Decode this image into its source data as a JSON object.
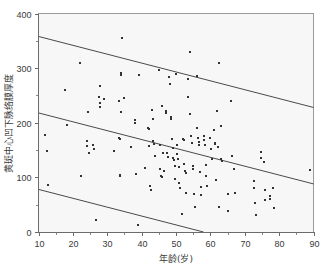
{
  "chart_data": {
    "type": "scatter",
    "title": "",
    "xlabel": "年龄(岁)",
    "ylabel": "黄斑中心凹下脉络膜厚度",
    "xlim": [
      10,
      90
    ],
    "ylim": [
      0,
      400
    ],
    "xticks": [
      10,
      20,
      30,
      40,
      50,
      60,
      70,
      80,
      90
    ],
    "yticks": [
      0,
      100,
      200,
      300,
      400
    ],
    "xtick_labels": [
      "10",
      "20",
      "30",
      "40",
      "50",
      "60",
      "70",
      "80",
      "90"
    ],
    "ytick_labels": [
      "0",
      "100",
      "200",
      "300",
      "400"
    ],
    "x_minor_ticks": [
      15,
      25,
      35,
      45,
      55,
      65,
      75,
      85
    ],
    "y_minor_ticks": [
      50,
      150,
      250,
      350
    ],
    "grid": false,
    "legend": null,
    "marker": "square",
    "marker_size": 2,
    "marker_color": "#333333",
    "plot_background": "#f7f7f7",
    "axis_color": "#6b6b6b",
    "line_color": "#4a4a4a",
    "series": [
      {
        "name": "subfoveal choroidal thickness",
        "points": [
          [
            12.0,
            177
          ],
          [
            12.6,
            148
          ],
          [
            12.8,
            86
          ],
          [
            17.8,
            260
          ],
          [
            18.2,
            196
          ],
          [
            22.2,
            310
          ],
          [
            22.5,
            103
          ],
          [
            24.0,
            166
          ],
          [
            24.2,
            158
          ],
          [
            24.4,
            220
          ],
          [
            24.6,
            145
          ],
          [
            25.8,
            160
          ],
          [
            26.0,
            152
          ],
          [
            26.8,
            22
          ],
          [
            27.6,
            247
          ],
          [
            27.8,
            237
          ],
          [
            27.9,
            228
          ],
          [
            28.0,
            267
          ],
          [
            29.0,
            243
          ],
          [
            32.0,
            148
          ],
          [
            33.4,
            240
          ],
          [
            33.5,
            173
          ],
          [
            33.6,
            171
          ],
          [
            33.7,
            105
          ],
          [
            33.8,
            102
          ],
          [
            33.9,
            219
          ],
          [
            34.0,
            287
          ],
          [
            34.1,
            292
          ],
          [
            34.2,
            356
          ],
          [
            35.0,
            245
          ],
          [
            36.8,
            156
          ],
          [
            38.0,
            205
          ],
          [
            38.2,
            200
          ],
          [
            38.4,
            107
          ],
          [
            38.8,
            12
          ],
          [
            39.2,
            288
          ],
          [
            41.0,
            117
          ],
          [
            41.8,
            190
          ],
          [
            42.0,
            189
          ],
          [
            42.2,
            158
          ],
          [
            42.4,
            84
          ],
          [
            42.6,
            76
          ],
          [
            43.0,
            223
          ],
          [
            43.2,
            207
          ],
          [
            43.4,
            167
          ],
          [
            43.6,
            161
          ],
          [
            44.0,
            140
          ],
          [
            45.0,
            297
          ],
          [
            45.2,
            159
          ],
          [
            45.4,
            115
          ],
          [
            45.6,
            103
          ],
          [
            45.8,
            100
          ],
          [
            46.0,
            230
          ],
          [
            46.2,
            145
          ],
          [
            46.4,
            111
          ],
          [
            47.0,
            218
          ],
          [
            47.2,
            222
          ],
          [
            47.4,
            144
          ],
          [
            47.6,
            138
          ],
          [
            48.0,
            284
          ],
          [
            48.2,
            271
          ],
          [
            48.4,
            210
          ],
          [
            48.6,
            206
          ],
          [
            48.8,
            171
          ],
          [
            49.0,
            153
          ],
          [
            49.2,
            135
          ],
          [
            49.4,
            132
          ],
          [
            49.6,
            121
          ],
          [
            49.8,
            97
          ],
          [
            50.0,
            289
          ],
          [
            50.2,
            159
          ],
          [
            50.4,
            142
          ],
          [
            50.6,
            133
          ],
          [
            50.8,
            119
          ],
          [
            51.0,
            89
          ],
          [
            51.2,
            80
          ],
          [
            51.6,
            33
          ],
          [
            52.0,
            171
          ],
          [
            52.2,
            169
          ],
          [
            52.4,
            125
          ],
          [
            52.6,
            112
          ],
          [
            52.8,
            108
          ],
          [
            53.0,
            72
          ],
          [
            53.4,
            281
          ],
          [
            53.6,
            248
          ],
          [
            54.0,
            330
          ],
          [
            54.2,
            216
          ],
          [
            54.4,
            176
          ],
          [
            54.6,
            163
          ],
          [
            54.8,
            120
          ],
          [
            55.0,
            116
          ],
          [
            55.2,
            70
          ],
          [
            55.4,
            46
          ],
          [
            56.0,
            285
          ],
          [
            56.2,
            191
          ],
          [
            56.4,
            173
          ],
          [
            56.6,
            165
          ],
          [
            56.8,
            160
          ],
          [
            57.0,
            110
          ],
          [
            57.2,
            82
          ],
          [
            57.4,
            68
          ],
          [
            58.0,
            175
          ],
          [
            58.2,
            168
          ],
          [
            58.4,
            159
          ],
          [
            58.6,
            122
          ],
          [
            58.8,
            102
          ],
          [
            59.0,
            85
          ],
          [
            60.0,
            172
          ],
          [
            60.2,
            152
          ],
          [
            60.4,
            133
          ],
          [
            61.0,
            186
          ],
          [
            61.2,
            163
          ],
          [
            61.4,
            161
          ],
          [
            61.6,
            95
          ],
          [
            62.0,
            221
          ],
          [
            62.2,
            155
          ],
          [
            62.4,
            46
          ],
          [
            62.6,
            310
          ],
          [
            63.0,
            194
          ],
          [
            63.2,
            134
          ],
          [
            63.4,
            130
          ],
          [
            65.0,
            70
          ],
          [
            65.2,
            39
          ],
          [
            66.0,
            240
          ],
          [
            66.2,
            140
          ],
          [
            67.0,
            116
          ],
          [
            67.2,
            71
          ],
          [
            72.6,
            93
          ],
          [
            72.8,
            80
          ],
          [
            73.0,
            54
          ],
          [
            73.2,
            31
          ],
          [
            74.6,
            146
          ],
          [
            74.8,
            135
          ],
          [
            75.6,
            128
          ],
          [
            75.8,
            76
          ],
          [
            76.0,
            59
          ],
          [
            77.2,
            66
          ],
          [
            77.4,
            60
          ],
          [
            78.2,
            80
          ],
          [
            78.4,
            44
          ],
          [
            89.0,
            114
          ]
        ]
      }
    ],
    "fit_lines": [
      {
        "name": "upper-prediction-bound",
        "x0": 10,
        "y0": 358,
        "x1": 90,
        "y1": 228
      },
      {
        "name": "regression-fit",
        "x0": 10,
        "y0": 218,
        "x1": 90,
        "y1": 88
      },
      {
        "name": "lower-prediction-bound",
        "x0": 10,
        "y0": 78,
        "x1": 58,
        "y1": 0
      }
    ]
  }
}
